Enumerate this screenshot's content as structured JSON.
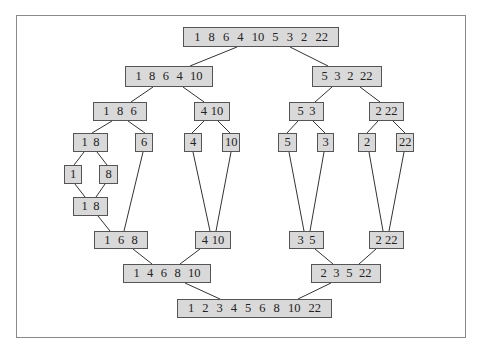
{
  "diagram": {
    "colors": {
      "node_fill": "#d9d9d9",
      "node_border": "#555555",
      "edge": "#333333",
      "frame": "#8a8a8a"
    },
    "nodes": [
      {
        "id": "n0",
        "values": [
          "1",
          "8",
          "6",
          "4",
          "10",
          "5",
          "3",
          "2",
          "22"
        ],
        "x": 183,
        "y": 27,
        "w": 156,
        "h": 20
      },
      {
        "id": "n1",
        "values": [
          "1",
          "8",
          "6",
          "4",
          "10"
        ],
        "x": 125,
        "y": 66,
        "w": 88,
        "h": 21
      },
      {
        "id": "n2",
        "values": [
          "5",
          "3",
          "2",
          "22"
        ],
        "x": 312,
        "y": 66,
        "w": 70,
        "h": 21
      },
      {
        "id": "n3",
        "values": [
          "1",
          "8",
          "6"
        ],
        "x": 93,
        "y": 102,
        "w": 54,
        "h": 19
      },
      {
        "id": "n4",
        "values": [
          "4",
          "10"
        ],
        "x": 194,
        "y": 102,
        "w": 36,
        "h": 19
      },
      {
        "id": "n5",
        "values": [
          "5",
          "3"
        ],
        "x": 289,
        "y": 102,
        "w": 35,
        "h": 19
      },
      {
        "id": "n6",
        "values": [
          "2",
          "22"
        ],
        "x": 369,
        "y": 102,
        "w": 35,
        "h": 19
      },
      {
        "id": "n7",
        "values": [
          "1",
          "8"
        ],
        "x": 73,
        "y": 133,
        "w": 35,
        "h": 19
      },
      {
        "id": "n8",
        "values": [
          "6"
        ],
        "x": 135,
        "y": 133,
        "w": 18,
        "h": 19
      },
      {
        "id": "n9",
        "values": [
          "4"
        ],
        "x": 184,
        "y": 133,
        "w": 18,
        "h": 19
      },
      {
        "id": "n10",
        "values": [
          "10"
        ],
        "x": 222,
        "y": 133,
        "w": 18,
        "h": 19
      },
      {
        "id": "n11",
        "values": [
          "5"
        ],
        "x": 278,
        "y": 133,
        "w": 19,
        "h": 19
      },
      {
        "id": "n12",
        "values": [
          "3"
        ],
        "x": 317,
        "y": 133,
        "w": 17,
        "h": 19
      },
      {
        "id": "n13",
        "values": [
          "2"
        ],
        "x": 358,
        "y": 133,
        "w": 18,
        "h": 19
      },
      {
        "id": "n14",
        "values": [
          "22"
        ],
        "x": 396,
        "y": 133,
        "w": 18,
        "h": 19
      },
      {
        "id": "n15",
        "values": [
          "1"
        ],
        "x": 64,
        "y": 165,
        "w": 18,
        "h": 19
      },
      {
        "id": "n16",
        "values": [
          "8"
        ],
        "x": 99,
        "y": 165,
        "w": 19,
        "h": 19
      },
      {
        "id": "n17",
        "values": [
          "1",
          "8"
        ],
        "x": 73,
        "y": 197,
        "w": 35,
        "h": 19
      },
      {
        "id": "n18",
        "values": [
          "1",
          "6",
          "8"
        ],
        "x": 94,
        "y": 231,
        "w": 54,
        "h": 18
      },
      {
        "id": "n19",
        "values": [
          "4",
          "10"
        ],
        "x": 195,
        "y": 231,
        "w": 36,
        "h": 18
      },
      {
        "id": "n20",
        "values": [
          "3",
          "5"
        ],
        "x": 289,
        "y": 231,
        "w": 35,
        "h": 18
      },
      {
        "id": "n21",
        "values": [
          "2",
          "22"
        ],
        "x": 369,
        "y": 231,
        "w": 35,
        "h": 18
      },
      {
        "id": "n22",
        "values": [
          "1",
          "4",
          "6",
          "8",
          "10"
        ],
        "x": 123,
        "y": 264,
        "w": 88,
        "h": 19
      },
      {
        "id": "n23",
        "values": [
          "2",
          "3",
          "5",
          "22"
        ],
        "x": 311,
        "y": 264,
        "w": 70,
        "h": 19
      },
      {
        "id": "n24",
        "values": [
          "1",
          "2",
          "3",
          "4",
          "5",
          "6",
          "8",
          "10",
          "22"
        ],
        "x": 177,
        "y": 299,
        "w": 155,
        "h": 19
      }
    ],
    "edges": [
      {
        "from": "n0",
        "to": "n1",
        "x1": 237,
        "y1": 47,
        "x2": 190,
        "y2": 66
      },
      {
        "from": "n0",
        "to": "n2",
        "x1": 290,
        "y1": 47,
        "x2": 328,
        "y2": 66
      },
      {
        "from": "n1",
        "to": "n3",
        "x1": 153,
        "y1": 87,
        "x2": 131,
        "y2": 102
      },
      {
        "from": "n1",
        "to": "n4",
        "x1": 183,
        "y1": 87,
        "x2": 204,
        "y2": 102
      },
      {
        "from": "n2",
        "to": "n5",
        "x1": 332,
        "y1": 87,
        "x2": 315,
        "y2": 102
      },
      {
        "from": "n2",
        "to": "n6",
        "x1": 360,
        "y1": 87,
        "x2": 380,
        "y2": 102
      },
      {
        "from": "n3",
        "to": "n7",
        "x1": 112,
        "y1": 121,
        "x2": 92,
        "y2": 133
      },
      {
        "from": "n3",
        "to": "n8",
        "x1": 128,
        "y1": 121,
        "x2": 145,
        "y2": 133
      },
      {
        "from": "n4",
        "to": "n9",
        "x1": 204,
        "y1": 121,
        "x2": 192,
        "y2": 133
      },
      {
        "from": "n4",
        "to": "n10",
        "x1": 218,
        "y1": 121,
        "x2": 230,
        "y2": 133
      },
      {
        "from": "n5",
        "to": "n11",
        "x1": 298,
        "y1": 121,
        "x2": 287,
        "y2": 133
      },
      {
        "from": "n5",
        "to": "n12",
        "x1": 313,
        "y1": 121,
        "x2": 325,
        "y2": 133
      },
      {
        "from": "n6",
        "to": "n13",
        "x1": 378,
        "y1": 121,
        "x2": 367,
        "y2": 133
      },
      {
        "from": "n6",
        "to": "n14",
        "x1": 393,
        "y1": 121,
        "x2": 405,
        "y2": 133
      },
      {
        "from": "n7",
        "to": "n15",
        "x1": 84,
        "y1": 152,
        "x2": 74,
        "y2": 165
      },
      {
        "from": "n7",
        "to": "n16",
        "x1": 97,
        "y1": 152,
        "x2": 107,
        "y2": 165
      },
      {
        "from": "n15",
        "to": "n17",
        "x1": 75,
        "y1": 184,
        "x2": 85,
        "y2": 197
      },
      {
        "from": "n16",
        "to": "n17",
        "x1": 105,
        "y1": 184,
        "x2": 96,
        "y2": 197
      },
      {
        "from": "n17",
        "to": "n18",
        "x1": 98,
        "y1": 216,
        "x2": 110,
        "y2": 231
      },
      {
        "from": "n8",
        "to": "n18",
        "x1": 143,
        "y1": 152,
        "x2": 124,
        "y2": 231
      },
      {
        "from": "n9",
        "to": "n19",
        "x1": 193,
        "y1": 152,
        "x2": 210,
        "y2": 231
      },
      {
        "from": "n10",
        "to": "n19",
        "x1": 231,
        "y1": 152,
        "x2": 216,
        "y2": 231
      },
      {
        "from": "n11",
        "to": "n20",
        "x1": 289,
        "y1": 152,
        "x2": 304,
        "y2": 231
      },
      {
        "from": "n12",
        "to": "n20",
        "x1": 324,
        "y1": 152,
        "x2": 310,
        "y2": 231
      },
      {
        "from": "n13",
        "to": "n21",
        "x1": 369,
        "y1": 152,
        "x2": 383,
        "y2": 231
      },
      {
        "from": "n14",
        "to": "n21",
        "x1": 404,
        "y1": 152,
        "x2": 389,
        "y2": 231
      },
      {
        "from": "n18",
        "to": "n22",
        "x1": 133,
        "y1": 249,
        "x2": 152,
        "y2": 264
      },
      {
        "from": "n19",
        "to": "n22",
        "x1": 200,
        "y1": 249,
        "x2": 180,
        "y2": 264
      },
      {
        "from": "n20",
        "to": "n23",
        "x1": 315,
        "y1": 249,
        "x2": 333,
        "y2": 264
      },
      {
        "from": "n21",
        "to": "n23",
        "x1": 376,
        "y1": 249,
        "x2": 359,
        "y2": 264
      },
      {
        "from": "n22",
        "to": "n24",
        "x1": 185,
        "y1": 283,
        "x2": 220,
        "y2": 299
      },
      {
        "from": "n23",
        "to": "n24",
        "x1": 331,
        "y1": 283,
        "x2": 298,
        "y2": 299
      }
    ]
  }
}
